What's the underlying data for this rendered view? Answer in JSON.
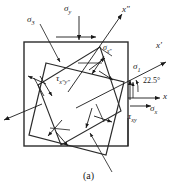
{
  "figure": {
    "caption": "(a)"
  },
  "labels": {
    "sigma_y": "σ",
    "sigma_y_sub": "y",
    "sigma_3": "σ",
    "sigma_3_sub": "3",
    "sigma_1": "σ",
    "sigma_1_sub": "1",
    "sigma_x": "σ",
    "sigma_x_sub": "x",
    "sigma_xpp": "σ",
    "sigma_xpp_sub": "x″",
    "tau_xy": "τ",
    "tau_xy_sub": "xy",
    "tau_xppypp": "τ",
    "tau_xppypp_sub": "x″y″",
    "axis_x": "x",
    "axis_xp": "x′",
    "axis_xpp": "x″",
    "angle": "22.5°"
  },
  "colors": {
    "ink": "#1a1a1a",
    "line": "#2b2b2b",
    "background": "#ffffff"
  }
}
